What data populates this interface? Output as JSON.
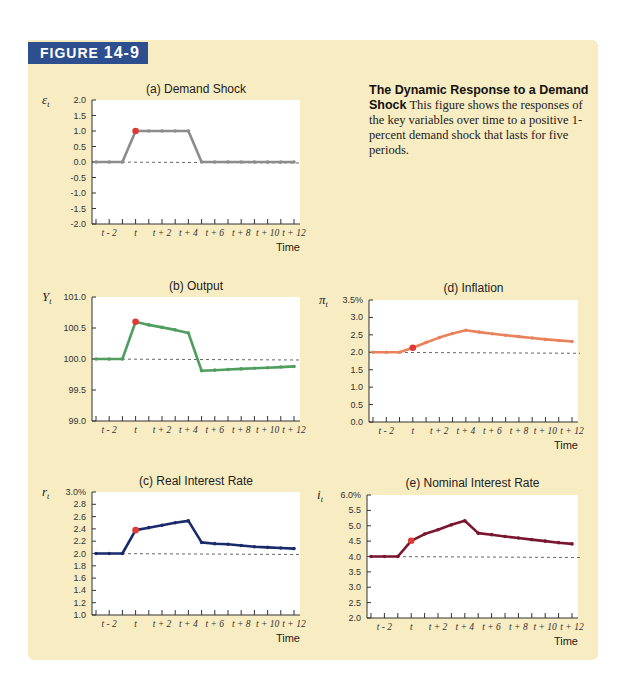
{
  "figure": {
    "badge_word": "FIGURE",
    "badge_number": "14-9",
    "caption_title": "The Dynamic Response to a Demand Shock",
    "caption_text": "This figure shows the responses of the key variables over time to a positive 1-percent demand shock that lasts for five periods."
  },
  "colors": {
    "panel_bg": "#f8ecc2",
    "badge_bg": "#2d4f8f",
    "shock_marker": "#e03a35",
    "baseline_dash": "#555555"
  },
  "x_axis": {
    "title": "Time",
    "periods": [
      "t-3",
      "t-2",
      "t-1",
      "t",
      "t+1",
      "t+2",
      "t+3",
      "t+4",
      "t+5",
      "t+6",
      "t+7",
      "t+8",
      "t+9",
      "t+10",
      "t+11",
      "t+12"
    ],
    "tick_labels": [
      {
        "index": 1,
        "text": "t - 2"
      },
      {
        "index": 3,
        "text": "t"
      },
      {
        "index": 5,
        "text": "t + 2"
      },
      {
        "index": 7,
        "text": "t + 4"
      },
      {
        "index": 9,
        "text": "t + 6"
      },
      {
        "index": 11,
        "text": "t + 8"
      },
      {
        "index": 13,
        "text": "t + 10"
      },
      {
        "index": 15,
        "text": "t + 12"
      }
    ]
  },
  "chart_data": [
    {
      "id": "a",
      "type": "line",
      "title": "(a) Demand Shock",
      "ylabel": "ε",
      "ylabel_sub": "t",
      "xlabel": "Time",
      "x": [
        "t-3",
        "t-2",
        "t-1",
        "t",
        "t+1",
        "t+2",
        "t+3",
        "t+4",
        "t+5",
        "t+6",
        "t+7",
        "t+8",
        "t+9",
        "t+10",
        "t+11",
        "t+12"
      ],
      "values": [
        0,
        0,
        0,
        1,
        1,
        1,
        1,
        1,
        0,
        0,
        0,
        0,
        0,
        0,
        0,
        0
      ],
      "baseline": 0.0,
      "ylim": [
        -2.0,
        2.0
      ],
      "yticks": [
        "2.0",
        "1.5",
        "1.0",
        "0.5",
        "0.0",
        "-0.5",
        "-1.0",
        "-1.5",
        "-2.0"
      ],
      "ytick_values": [
        2.0,
        1.5,
        1.0,
        0.5,
        0.0,
        -0.5,
        -1.0,
        -1.5,
        -2.0
      ],
      "highlight_index": 3,
      "color": "#8c8c8c",
      "grid": false
    },
    {
      "id": "b",
      "type": "line",
      "title": "(b) Output",
      "ylabel": "Y",
      "ylabel_sub": "t",
      "xlabel": "Time",
      "x": [
        "t-3",
        "t-2",
        "t-1",
        "t",
        "t+1",
        "t+2",
        "t+3",
        "t+4",
        "t+5",
        "t+6",
        "t+7",
        "t+8",
        "t+9",
        "t+10",
        "t+11",
        "t+12"
      ],
      "values": [
        100.0,
        100.0,
        100.0,
        100.6,
        100.55,
        100.51,
        100.47,
        100.42,
        99.81,
        99.82,
        99.83,
        99.84,
        99.85,
        99.86,
        99.87,
        99.88
      ],
      "baseline": 100.0,
      "ylim": [
        99.0,
        101.0
      ],
      "yticks": [
        "101.0",
        "100.5",
        "100.0",
        "99.5",
        "99.0"
      ],
      "ytick_values": [
        101.0,
        100.5,
        100.0,
        99.5,
        99.0
      ],
      "highlight_index": 3,
      "color": "#4f9e5e",
      "grid": false
    },
    {
      "id": "c",
      "type": "line",
      "title": "(c) Real Interest Rate",
      "ylabel": "r",
      "ylabel_sub": "t",
      "xlabel": "Time",
      "x": [
        "t-3",
        "t-2",
        "t-1",
        "t",
        "t+1",
        "t+2",
        "t+3",
        "t+4",
        "t+5",
        "t+6",
        "t+7",
        "t+8",
        "t+9",
        "t+10",
        "t+11",
        "t+12"
      ],
      "values": [
        2.0,
        2.0,
        2.0,
        2.38,
        2.42,
        2.46,
        2.5,
        2.53,
        2.18,
        2.16,
        2.15,
        2.13,
        2.11,
        2.1,
        2.09,
        2.08
      ],
      "baseline": 2.0,
      "ylim": [
        1.0,
        3.0
      ],
      "yticks": [
        "3.0%",
        "2.8",
        "2.6",
        "2.4",
        "2.2",
        "2.0",
        "1.8",
        "1.6",
        "1.4",
        "1.2",
        "1.0"
      ],
      "ytick_values": [
        3.0,
        2.8,
        2.6,
        2.4,
        2.2,
        2.0,
        1.8,
        1.6,
        1.4,
        1.2,
        1.0
      ],
      "highlight_index": 3,
      "color": "#1a2a6b",
      "grid": false
    },
    {
      "id": "d",
      "type": "line",
      "title": "(d) Inflation",
      "ylabel": "π",
      "ylabel_sub": "t",
      "xlabel": "Time",
      "x": [
        "t-3",
        "t-2",
        "t-1",
        "t",
        "t+1",
        "t+2",
        "t+3",
        "t+4",
        "t+5",
        "t+6",
        "t+7",
        "t+8",
        "t+9",
        "t+10",
        "t+11",
        "t+12"
      ],
      "values": [
        2.0,
        2.0,
        2.0,
        2.13,
        2.28,
        2.42,
        2.54,
        2.63,
        2.58,
        2.53,
        2.49,
        2.45,
        2.41,
        2.37,
        2.34,
        2.31
      ],
      "baseline": 2.0,
      "ylim": [
        0.0,
        3.5
      ],
      "yticks": [
        "3.5%",
        "3.0",
        "2.5",
        "2.0",
        "1.5",
        "1.0",
        "0.5",
        "0.0"
      ],
      "ytick_values": [
        3.5,
        3.0,
        2.5,
        2.0,
        1.5,
        1.0,
        0.5,
        0.0
      ],
      "highlight_index": 3,
      "color": "#e8825a",
      "grid": false
    },
    {
      "id": "e",
      "type": "line",
      "title": "(e) Nominal Interest Rate",
      "ylabel": "i",
      "ylabel_sub": "t",
      "xlabel": "Time",
      "x": [
        "t-3",
        "t-2",
        "t-1",
        "t",
        "t+1",
        "t+2",
        "t+3",
        "t+4",
        "t+5",
        "t+6",
        "t+7",
        "t+8",
        "t+9",
        "t+10",
        "t+11",
        "t+12"
      ],
      "values": [
        4.0,
        4.0,
        4.0,
        4.51,
        4.73,
        4.87,
        5.03,
        5.16,
        4.76,
        4.71,
        4.65,
        4.6,
        4.55,
        4.5,
        4.45,
        4.41
      ],
      "baseline": 4.0,
      "ylim": [
        2.0,
        6.0
      ],
      "yticks": [
        "6.0%",
        "5.5",
        "5.0",
        "4.5",
        "4.0",
        "3.5",
        "3.0",
        "2.5",
        "2.0"
      ],
      "ytick_values": [
        6.0,
        5.5,
        5.0,
        4.5,
        4.0,
        3.5,
        3.0,
        2.5,
        2.0
      ],
      "highlight_index": 3,
      "color": "#7a1530",
      "grid": false
    }
  ]
}
